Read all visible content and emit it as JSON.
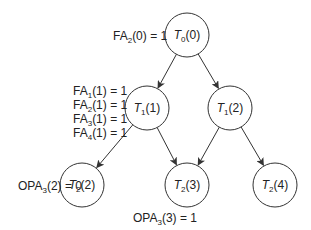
{
  "nodes": [
    {
      "id": "T0_0",
      "base": "T",
      "sub": "0",
      "arg": "(0)",
      "cx": 187,
      "cy": 35
    },
    {
      "id": "T1_1",
      "base": "T",
      "sub": "1",
      "arg": "(1)",
      "cx": 147,
      "cy": 108
    },
    {
      "id": "T1_2",
      "base": "T",
      "sub": "1",
      "arg": "(2)",
      "cx": 230,
      "cy": 108
    },
    {
      "id": "T2_2",
      "base": "T",
      "sub": "2",
      "arg": "(2)",
      "cx": 82,
      "cy": 185
    },
    {
      "id": "T2_3",
      "base": "T",
      "sub": "2",
      "arg": "(3)",
      "cx": 187,
      "cy": 185
    },
    {
      "id": "T2_4",
      "base": "T",
      "sub": "2",
      "arg": "(4)",
      "cx": 275,
      "cy": 185
    }
  ],
  "edges": [
    {
      "from": "T0_0",
      "to": "T1_1"
    },
    {
      "from": "T0_0",
      "to": "T1_2"
    },
    {
      "from": "T1_1",
      "to": "T2_2"
    },
    {
      "from": "T1_1",
      "to": "T2_3"
    },
    {
      "from": "T1_2",
      "to": "T2_3"
    },
    {
      "from": "T1_2",
      "to": "T2_4"
    }
  ],
  "annotations": [
    {
      "base": "FA",
      "sub": "2",
      "rest": "(0) = 1",
      "x": 113,
      "y": 40
    },
    {
      "base": "FA",
      "sub": "1",
      "rest": "(1) = 1",
      "x": 73,
      "y": 95
    },
    {
      "base": "FA",
      "sub": "2",
      "rest": "(1) = 1",
      "x": 73,
      "y": 109
    },
    {
      "base": "FA",
      "sub": "3",
      "rest": "(1) = 1",
      "x": 73,
      "y": 123
    },
    {
      "base": "FA",
      "sub": "4",
      "rest": "(1) = 1",
      "x": 73,
      "y": 137
    },
    {
      "base": "OPA",
      "sub": "3",
      "rest": "(2) = 0",
      "x": 18,
      "y": 190
    },
    {
      "base": "OPA",
      "sub": "3",
      "rest": "(3) = 1",
      "x": 133,
      "y": 222
    }
  ],
  "style": {
    "stroke": "#333333",
    "radius": 22
  }
}
